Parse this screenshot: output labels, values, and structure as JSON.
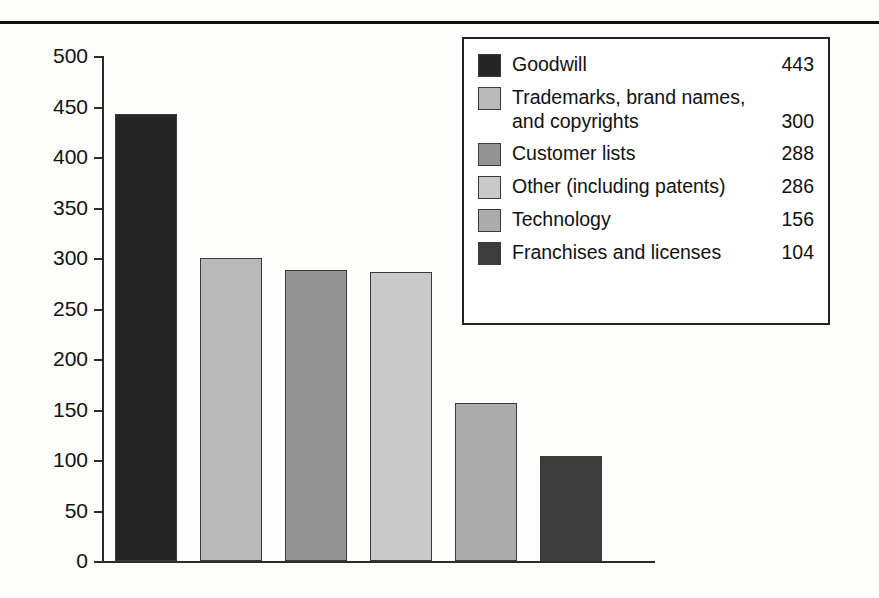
{
  "chart_data": {
    "type": "bar",
    "title": "",
    "xlabel": "",
    "ylabel": "",
    "ylim": [
      0,
      500
    ],
    "grid": false,
    "legend_position": "top-right",
    "categories": [
      "Goodwill",
      "Trademarks, brand names, and copyrights",
      "Customer lists",
      "Other  (including patents)",
      "Technology",
      "Franchises and licenses"
    ],
    "values": [
      443,
      300,
      288,
      286,
      156,
      104
    ],
    "colors": [
      "#262626",
      "#b9b9b9",
      "#949494",
      "#c9c9c9",
      "#ababab",
      "#3d3d3d"
    ],
    "yticks": [
      0,
      50,
      100,
      150,
      200,
      250,
      300,
      350,
      400,
      450,
      500
    ],
    "ytick_labels": [
      "0",
      "50",
      "100",
      "150",
      "200",
      "250",
      "300",
      "350",
      "400",
      "450",
      "500"
    ]
  },
  "legend": {
    "items": [
      {
        "label": "Goodwill",
        "value": "443",
        "color": "#262626",
        "two_line": false,
        "line1": "Goodwill",
        "line2": ""
      },
      {
        "label": "Trademarks, brand names, and copyrights",
        "value": "300",
        "color": "#b9b9b9",
        "two_line": true,
        "line1": "Trademarks, brand names,",
        "line2": "and copyrights"
      },
      {
        "label": "Customer lists",
        "value": "288",
        "color": "#949494",
        "two_line": false,
        "line1": "Customer lists",
        "line2": ""
      },
      {
        "label": "Other  (including patents)",
        "value": "286",
        "color": "#c9c9c9",
        "two_line": false,
        "line1": "Other  (including patents)",
        "line2": ""
      },
      {
        "label": "Technology",
        "value": "156",
        "color": "#ababab",
        "two_line": false,
        "line1": "Technology",
        "line2": ""
      },
      {
        "label": "Franchises and licenses",
        "value": "104",
        "color": "#3d3d3d",
        "two_line": false,
        "line1": "Franchises and licenses",
        "line2": ""
      }
    ]
  }
}
